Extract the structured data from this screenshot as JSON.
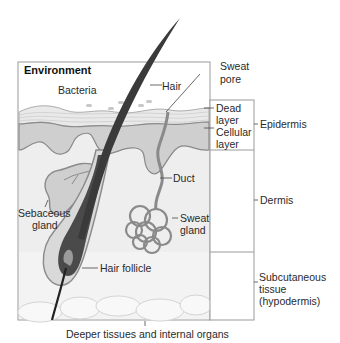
{
  "diagram": {
    "title_label": "Environment",
    "labels": {
      "bacteria": "Bacteria",
      "hair": "Hair",
      "sweat_pore_1": "Sweat",
      "sweat_pore_2": "pore",
      "dead_layer_1": "Dead",
      "dead_layer_2": "layer",
      "cellular_layer_1": "Cellular",
      "cellular_layer_2": "layer",
      "duct": "Duct",
      "sebaceous_gland_1": "Sebaceous",
      "sebaceous_gland_2": "gland",
      "sweat_gland_1": "Sweat",
      "sweat_gland_2": "gland",
      "hair_follicle": "Hair follicle"
    },
    "layers": {
      "epidermis": "Epidermis",
      "dermis": "Dermis",
      "subcutaneous_1": "Subcutaneous",
      "subcutaneous_2": "tissue",
      "subcutaneous_3": "(hypodermis)"
    },
    "footer": "Deeper tissues and internal organs",
    "colors": {
      "background": "#ffffff",
      "tissue_light": "#e6e6e6",
      "tissue_mid": "#cfcfcf",
      "outline": "#8a8a8a",
      "hair": "#3a3a3a",
      "frame": "#9a9a9a"
    }
  }
}
